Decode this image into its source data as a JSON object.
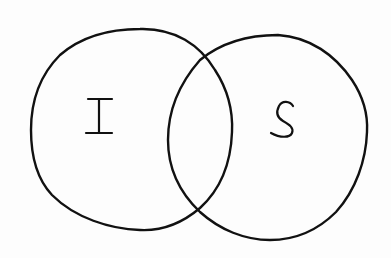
{
  "diagram": {
    "type": "venn",
    "style": "hand-drawn",
    "background_color": "#fdfdfd",
    "stroke_color": "#111111",
    "sets": [
      {
        "id": "left",
        "label": "I",
        "center": [
          131,
          130
        ],
        "radius_x": 101,
        "radius_y": 101
      },
      {
        "id": "right",
        "label": "S",
        "center": [
          268,
          137
        ],
        "radius_x": 100,
        "radius_y": 103
      }
    ],
    "intersections": [
      {
        "position": "top",
        "point": [
          202,
          58
        ]
      },
      {
        "position": "bottom",
        "point": [
          195,
          210
        ]
      }
    ]
  }
}
